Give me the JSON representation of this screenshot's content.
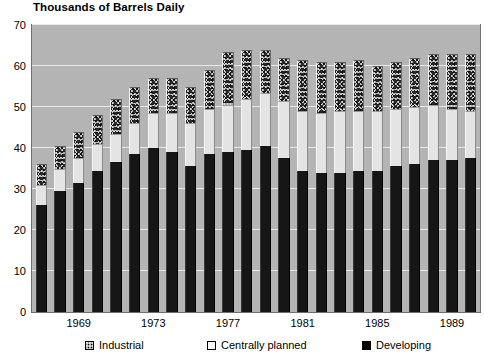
{
  "chart_data": {
    "type": "bar",
    "subtype": "stacked-column",
    "title": "Thousands of Barrels Daily",
    "xlabel": "",
    "ylabel": "",
    "ylim": [
      0,
      70
    ],
    "ytick_values": [
      0,
      10,
      20,
      30,
      40,
      50,
      60,
      70
    ],
    "ytick_labels": [
      "0",
      "10",
      "20",
      "30",
      "40",
      "50",
      "60",
      "70"
    ],
    "grid": true,
    "grid_axis": "y",
    "legend_position": "bottom",
    "categories": [
      1967,
      1968,
      1969,
      1970,
      1971,
      1972,
      1973,
      1974,
      1975,
      1976,
      1977,
      1978,
      1979,
      1980,
      1981,
      1982,
      1983,
      1984,
      1985,
      1986,
      1987,
      1988,
      1989,
      1990
    ],
    "xtick_labels": [
      "1969",
      "1973",
      "1977",
      "1981",
      "1985",
      "1989"
    ],
    "xtick_categories": [
      1969,
      1973,
      1977,
      1981,
      1985,
      1989
    ],
    "series": [
      {
        "name": "Developing",
        "color": "#161616",
        "pattern": "solid-black",
        "values": [
          26.0,
          29.5,
          31.5,
          34.5,
          36.5,
          38.5,
          40.0,
          39.0,
          35.5,
          38.5,
          39.0,
          39.5,
          40.5,
          37.5,
          34.5,
          34.0,
          34.0,
          34.5,
          34.5,
          35.5,
          36.0,
          37.0,
          37.0,
          37.5
        ]
      },
      {
        "name": "Centrally planned",
        "color": "#e4e4e4",
        "pattern": "white",
        "values": [
          5.0,
          5.5,
          6.0,
          6.5,
          7.0,
          7.5,
          8.5,
          9.5,
          10.5,
          11.0,
          11.5,
          12.5,
          13.0,
          14.0,
          14.5,
          14.5,
          15.0,
          14.5,
          14.5,
          14.0,
          14.0,
          13.5,
          12.5,
          11.5
        ]
      },
      {
        "name": "Industrial",
        "color": "#d8d8d8",
        "pattern": "stippled",
        "values": [
          5.0,
          5.5,
          6.5,
          7.0,
          8.5,
          9.0,
          8.5,
          8.5,
          9.0,
          9.5,
          13.0,
          12.0,
          10.5,
          10.5,
          12.5,
          12.5,
          12.0,
          12.5,
          11.0,
          11.5,
          12.0,
          12.5,
          13.5,
          14.0
        ]
      }
    ],
    "totals": [
      36.0,
      40.5,
      44.0,
      48.0,
      52.0,
      55.0,
      57.0,
      57.0,
      55.0,
      59.0,
      63.5,
      64.0,
      64.0,
      62.0,
      61.5,
      61.0,
      61.0,
      61.5,
      60.0,
      61.0,
      62.0,
      63.0,
      63.0,
      63.0
    ]
  },
  "legend": {
    "items": [
      {
        "label": "Industrial",
        "swatch": "stippled-swatch"
      },
      {
        "label": "Centrally planned",
        "swatch": "white-swatch"
      },
      {
        "label": "Developing",
        "swatch": "black-swatch"
      }
    ]
  }
}
